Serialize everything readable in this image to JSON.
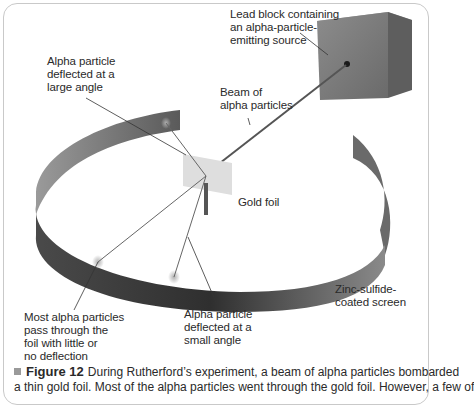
{
  "figure": {
    "number_label": "Figure 12",
    "caption_line1": "During Rutherford’s experiment, a beam of alpha particles bombarded",
    "caption_line2": "a thin gold foil. Most of the alpha particles went through the gold foil. However, a few of"
  },
  "labels": {
    "lead_block": "Lead block containing\nan alpha-particle-\nemitting source",
    "large_angle": "Alpha particle\ndeflected at a\nlarge angle",
    "beam": "Beam of\nalpha particles",
    "gold_foil": "Gold foil",
    "zinc_screen": "Zinc-sulfide-\ncoated screen",
    "most_pass": "Most alpha particles\npass through the\nfoil with little or\nno deflection",
    "small_angle": "Alpha particle\ndeflected at a\nsmall angle"
  },
  "colors": {
    "screen_dark": "#3a3a3a",
    "screen_mid": "#6e6e6e",
    "lead_block": "#808080",
    "gold_foil": "#dcdcdc",
    "beam": "#555555",
    "text": "#2a2a2a"
  }
}
